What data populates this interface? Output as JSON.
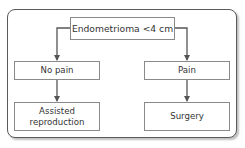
{
  "diagram": {
    "type": "flowchart",
    "nodes": {
      "root": "Endometrioma <4 cm",
      "no_pain": "No pain",
      "pain": "Pain",
      "assisted": "Assisted reproduction",
      "surgery": "Surgery"
    },
    "edges": [
      {
        "from": "root",
        "to": "no_pain"
      },
      {
        "from": "root",
        "to": "pain"
      },
      {
        "from": "no_pain",
        "to": "assisted"
      },
      {
        "from": "pain",
        "to": "surgery"
      }
    ],
    "colors": {
      "frame_border": "#5a5a5a",
      "box_border": "#8a8a8a",
      "arrow": "#555555",
      "text": "#333333"
    }
  }
}
